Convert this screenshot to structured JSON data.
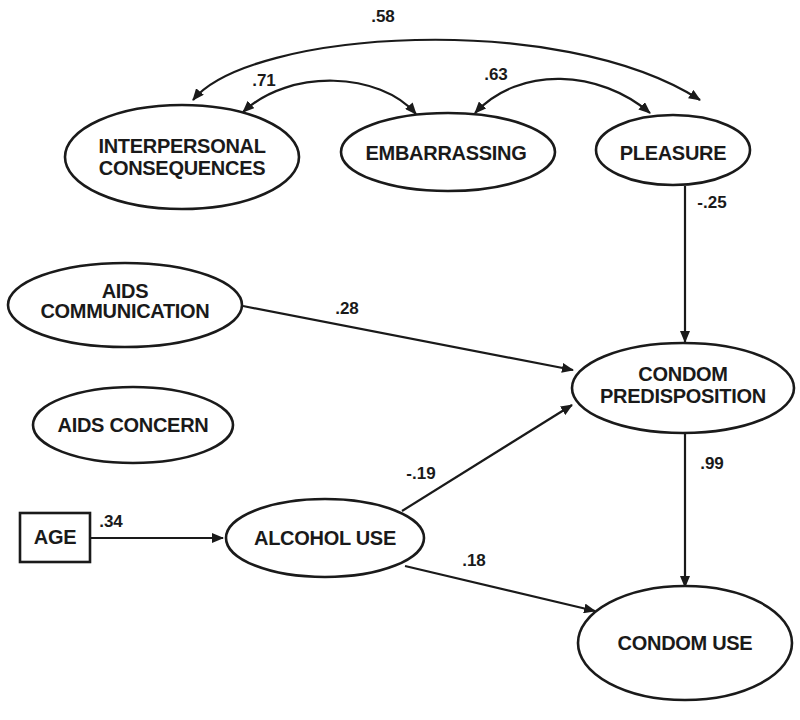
{
  "diagram": {
    "type": "path-model",
    "nodes": [
      {
        "id": "interpersonal",
        "shape": "ellipse",
        "lines": [
          "INTERPERSONAL",
          "CONSEQUENCES"
        ]
      },
      {
        "id": "embarrassing",
        "shape": "ellipse",
        "lines": [
          "EMBARRASSING"
        ]
      },
      {
        "id": "pleasure",
        "shape": "ellipse",
        "lines": [
          "PLEASURE"
        ]
      },
      {
        "id": "aids_communication",
        "shape": "ellipse",
        "lines": [
          "AIDS",
          "COMMUNICATION"
        ]
      },
      {
        "id": "aids_concern",
        "shape": "ellipse",
        "lines": [
          "AIDS CONCERN"
        ]
      },
      {
        "id": "condom_predisposition",
        "shape": "ellipse",
        "lines": [
          "CONDOM",
          "PREDISPOSITION"
        ]
      },
      {
        "id": "age",
        "shape": "rectangle",
        "lines": [
          "AGE"
        ]
      },
      {
        "id": "alcohol_use",
        "shape": "ellipse",
        "lines": [
          "ALCOHOL USE"
        ]
      },
      {
        "id": "condom_use",
        "shape": "ellipse",
        "lines": [
          "CONDOM USE"
        ]
      }
    ],
    "edges": [
      {
        "from": "interpersonal",
        "to": "pleasure",
        "type": "correlation",
        "coefficient": ".58"
      },
      {
        "from": "interpersonal",
        "to": "embarrassing",
        "type": "correlation",
        "coefficient": ".71"
      },
      {
        "from": "embarrassing",
        "to": "pleasure",
        "type": "correlation",
        "coefficient": ".63"
      },
      {
        "from": "pleasure",
        "to": "condom_predisposition",
        "type": "path",
        "coefficient": "-.25"
      },
      {
        "from": "aids_communication",
        "to": "condom_predisposition",
        "type": "path",
        "coefficient": ".28"
      },
      {
        "from": "alcohol_use",
        "to": "condom_predisposition",
        "type": "path",
        "coefficient": "-.19"
      },
      {
        "from": "age",
        "to": "alcohol_use",
        "type": "path",
        "coefficient": ".34"
      },
      {
        "from": "alcohol_use",
        "to": "condom_use",
        "type": "path",
        "coefficient": ".18"
      },
      {
        "from": "condom_predisposition",
        "to": "condom_use",
        "type": "path",
        "coefficient": ".99"
      }
    ]
  }
}
